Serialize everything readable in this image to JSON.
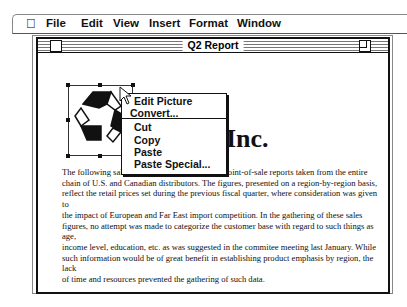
{
  "menubar": {
    "apple_icon": "",
    "items": [
      "File",
      "Edit",
      "View",
      "Insert",
      "Format",
      "Window"
    ]
  },
  "window": {
    "title": "Q2 Report"
  },
  "document": {
    "heading_visible": "Inc.",
    "picture": "recycle-symbol",
    "paragraph_lines": [
      "The following sales figures are compiled from point-of-sale reports taken from the entire",
      "chain of U.S. and Canadian distributors.  The figures, presented on a region-by-region basis,",
      "reflect the retail prices set during the previous fiscal quarter, where consideration was  given to",
      "the impact of European and Far East import competition.  In the gathering of these sales",
      "figures, no attempt was made to categorize the customer base with regard to such things as age,",
      "income level, education, etc. as was suggested in the commitee meeting last January.  While",
      "such information would be of great benefit in establishing product emphasis by region, the lack",
      "of time and resources prevented the gathering of such data."
    ]
  },
  "context_menu": {
    "items": [
      "Edit Picture",
      "Convert...",
      "Cut",
      "Copy",
      "Paste",
      "Paste Special..."
    ]
  }
}
